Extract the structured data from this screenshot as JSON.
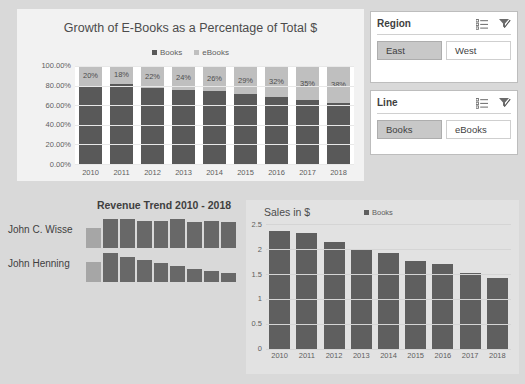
{
  "colors": {
    "page_background": "#d9d9d9",
    "panel_background": "#f2f2f2",
    "books_series": "#595959",
    "ebooks_series": "#bfbfbf",
    "slicer_selected": "#c8c8c8",
    "sales_panel_background": "#e2e2e2"
  },
  "pct_chart": {
    "icons": {
      "books_swatch": "square-swatch-icon",
      "ebooks_swatch": "square-swatch-icon"
    }
  },
  "slicers": [
    {
      "title": "Region",
      "multiselect_icon": "multi-select-icon",
      "clear_filter_icon": "clear-filter-icon",
      "items": [
        {
          "label": "East",
          "selected": true
        },
        {
          "label": "West",
          "selected": false
        }
      ]
    },
    {
      "title": "Line",
      "multiselect_icon": "multi-select-icon",
      "clear_filter_icon": "clear-filter-icon",
      "items": [
        {
          "label": "Books",
          "selected": true
        },
        {
          "label": "eBooks",
          "selected": false
        }
      ]
    }
  ],
  "trend": {
    "title": "Revenue Trend 2010 - 2018",
    "rows": [
      {
        "name": "John C. Wisse",
        "values": [
          0.62,
          0.9,
          0.92,
          0.84,
          0.84,
          0.92,
          0.8,
          0.84,
          0.8
        ]
      },
      {
        "name": "John Henning",
        "values": [
          0.62,
          0.92,
          0.78,
          0.68,
          0.6,
          0.5,
          0.42,
          0.34,
          0.28
        ]
      }
    ]
  },
  "chart_data": [
    {
      "type": "bar",
      "title": "Growth of E-Books as a Percentage of Total $",
      "subtype": "stacked-100-percent",
      "categories": [
        "2010",
        "2011",
        "2012",
        "2013",
        "2014",
        "2015",
        "2016",
        "2017",
        "2018"
      ],
      "series": [
        {
          "name": "Books",
          "values": [
            80,
            82,
            78,
            76,
            74,
            71,
            68,
            65,
            62
          ]
        },
        {
          "name": "eBooks",
          "values": [
            20,
            18,
            22,
            24,
            26,
            29,
            32,
            35,
            38
          ]
        }
      ],
      "data_labels": [
        "20%",
        "18%",
        "22%",
        "24%",
        "26%",
        "29%",
        "32%",
        "35%",
        "38%"
      ],
      "xlabel": "",
      "ylabel": "",
      "ylim": [
        0,
        100
      ],
      "ytick_labels": [
        "100.00%",
        "80.00%",
        "60.00%",
        "40.00%",
        "20.00%",
        "0.00%"
      ],
      "grid": true,
      "legend": [
        "Books",
        "eBooks"
      ],
      "legend_position": "top"
    },
    {
      "type": "bar",
      "title": "Sales in $",
      "categories": [
        "2010",
        "2011",
        "2012",
        "2013",
        "2014",
        "2015",
        "2016",
        "2017",
        "2018"
      ],
      "series": [
        {
          "name": "Books",
          "values": [
            2.37,
            2.33,
            2.15,
            2.0,
            1.93,
            1.77,
            1.7,
            1.52,
            1.42
          ]
        }
      ],
      "xlabel": "",
      "ylabel": "",
      "ylim": [
        0,
        2.5
      ],
      "ytick_labels": [
        "2.5",
        "2",
        "1.5",
        "1",
        "0.5",
        "0"
      ],
      "grid": true,
      "legend": [
        "Books"
      ],
      "legend_position": "top"
    }
  ]
}
